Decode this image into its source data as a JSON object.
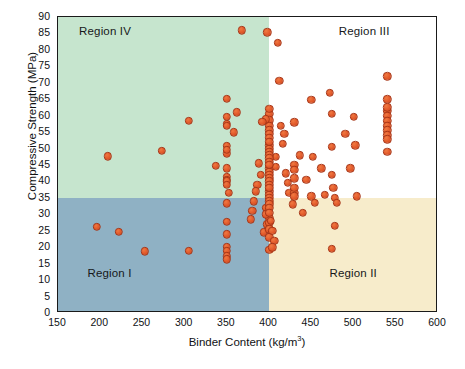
{
  "chart_data": {
    "type": "scatter",
    "title": "",
    "xlabel": "Binder Content (kg/m3)",
    "xlabel_base": "Binder Content (kg/m",
    "xlabel_sup": "3",
    "xlabel_tail": ")",
    "ylabel": "Compressive Strength (MPa)",
    "xlim": [
      150,
      600
    ],
    "ylim": [
      0,
      90
    ],
    "xticks": [
      150,
      200,
      250,
      300,
      350,
      400,
      450,
      500,
      550,
      600
    ],
    "yticks": [
      0,
      5,
      10,
      15,
      20,
      25,
      30,
      35,
      40,
      45,
      50,
      55,
      60,
      65,
      70,
      75,
      80,
      85,
      90
    ],
    "xtick_step": 50,
    "ytick_step": 5,
    "grid": false,
    "legend": false,
    "marker_color": "#E2592A",
    "marker_edge_color": "#A83617",
    "divider_x": 400,
    "divider_y": 35,
    "regions": [
      {
        "name": "region-iv",
        "label": "Region IV",
        "color": "#C6E5CE",
        "x_range": [
          150,
          400
        ],
        "y_range": [
          35,
          90
        ],
        "label_x": 175,
        "label_y": 85.5
      },
      {
        "name": "region-iii",
        "label": "Region III",
        "color": "#FFFFFF",
        "x_range": [
          400,
          600
        ],
        "y_range": [
          35,
          90
        ],
        "label_x": 545,
        "label_y": 85.5
      },
      {
        "name": "region-i",
        "label": "Region I",
        "color": "#8FB1C4",
        "x_range": [
          150,
          400
        ],
        "y_range": [
          0,
          35
        ],
        "label_x": 185,
        "label_y": 12.0
      },
      {
        "name": "region-ii",
        "label": "Region II",
        "color": "#F7ECCB",
        "x_range": [
          400,
          600
        ],
        "y_range": [
          0,
          35
        ],
        "label_x": 530,
        "label_y": 12.0
      }
    ],
    "points": [
      [
        196,
        26.2
      ],
      [
        222,
        24.6
      ],
      [
        253,
        18.8
      ],
      [
        305,
        18.9
      ],
      [
        209,
        47.7
      ],
      [
        273,
        49.4
      ],
      [
        305,
        58.4
      ],
      [
        337,
        44.7
      ],
      [
        350,
        65.1
      ],
      [
        350,
        59.6
      ],
      [
        350,
        57.6
      ],
      [
        350,
        57.0
      ],
      [
        350,
        50.8
      ],
      [
        350,
        49.6
      ],
      [
        350,
        48.6
      ],
      [
        350,
        44.0
      ],
      [
        350,
        41.5
      ],
      [
        350,
        40.5
      ],
      [
        350,
        40.0
      ],
      [
        350,
        39.0
      ],
      [
        350,
        33.4
      ],
      [
        350,
        27.7
      ],
      [
        350,
        23.9
      ],
      [
        350,
        20.1
      ],
      [
        350,
        18.9
      ],
      [
        350,
        17.2
      ],
      [
        350,
        16.3
      ],
      [
        368,
        86.0
      ],
      [
        362,
        61.0
      ],
      [
        358,
        55.0
      ],
      [
        352,
        36.5
      ],
      [
        398,
        85.4
      ],
      [
        396,
        58.9
      ],
      [
        392,
        58.2
      ],
      [
        400,
        62.0
      ],
      [
        400,
        60.5
      ],
      [
        400,
        58.6
      ],
      [
        400,
        57.0
      ],
      [
        400,
        55.5
      ],
      [
        400,
        54.4
      ],
      [
        400,
        53.2
      ],
      [
        400,
        52.0
      ],
      [
        400,
        51.0
      ],
      [
        400,
        50.0
      ],
      [
        400,
        49.0
      ],
      [
        400,
        48.0
      ],
      [
        400,
        47.0
      ],
      [
        400,
        46.0
      ],
      [
        400,
        45.0
      ],
      [
        400,
        44.0
      ],
      [
        400,
        43.0
      ],
      [
        400,
        42.0
      ],
      [
        400,
        41.0
      ],
      [
        400,
        40.0
      ],
      [
        400,
        39.0
      ],
      [
        400,
        38.0
      ],
      [
        400,
        37.0
      ],
      [
        400,
        36.0
      ],
      [
        400,
        35.0
      ],
      [
        400,
        34.0
      ],
      [
        400,
        33.0
      ],
      [
        400,
        32.0
      ],
      [
        400,
        30.5
      ],
      [
        400,
        29.0
      ],
      [
        400,
        27.5
      ],
      [
        400,
        25.5
      ],
      [
        400,
        23.0
      ],
      [
        400,
        19.2
      ],
      [
        410,
        82.2
      ],
      [
        412,
        70.6
      ],
      [
        408,
        47.5
      ],
      [
        408,
        44.5
      ],
      [
        414,
        57.0
      ],
      [
        416,
        51.5
      ],
      [
        418,
        54.5
      ],
      [
        420,
        42.5
      ],
      [
        422,
        39.5
      ],
      [
        424,
        36.5
      ],
      [
        428,
        33.0
      ],
      [
        430,
        58.0
      ],
      [
        430,
        45.0
      ],
      [
        430,
        43.5
      ],
      [
        430,
        41.0
      ],
      [
        430,
        38.0
      ],
      [
        430,
        36.5
      ],
      [
        430,
        35.5
      ],
      [
        436,
        48.0
      ],
      [
        440,
        30.5
      ],
      [
        444,
        40.5
      ],
      [
        450,
        64.8
      ],
      [
        452,
        47.5
      ],
      [
        450,
        35.5
      ],
      [
        454,
        33.5
      ],
      [
        462,
        44.0
      ],
      [
        466,
        36.0
      ],
      [
        472,
        67.0
      ],
      [
        474,
        60.5
      ],
      [
        474,
        50.5
      ],
      [
        474,
        42.0
      ],
      [
        476,
        38.0
      ],
      [
        478,
        35.0
      ],
      [
        480,
        33.5
      ],
      [
        478,
        26.5
      ],
      [
        474,
        19.5
      ],
      [
        490,
        54.5
      ],
      [
        496,
        44.0
      ],
      [
        500,
        59.6
      ],
      [
        502,
        51.0
      ],
      [
        504,
        35.5
      ],
      [
        540,
        72.0
      ],
      [
        540,
        65.0
      ],
      [
        540,
        62.5
      ],
      [
        540,
        61.5
      ],
      [
        540,
        60.0
      ],
      [
        540,
        58.5
      ],
      [
        540,
        57.0
      ],
      [
        540,
        55.5
      ],
      [
        540,
        54.0
      ],
      [
        540,
        52.8
      ],
      [
        540,
        49.0
      ],
      [
        396,
        32.0
      ],
      [
        396,
        30.0
      ],
      [
        402,
        28.0
      ],
      [
        404,
        25.0
      ],
      [
        406,
        22.0
      ],
      [
        404,
        20.0
      ],
      [
        398,
        27.0
      ],
      [
        394,
        24.5
      ],
      [
        390,
        42.0
      ],
      [
        388,
        45.5
      ],
      [
        386,
        39.0
      ],
      [
        384,
        37.0
      ],
      [
        382,
        34.0
      ],
      [
        380,
        31.0
      ],
      [
        378,
        28.5
      ]
    ]
  }
}
